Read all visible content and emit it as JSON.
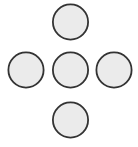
{
  "figure": {
    "name": "quincunx-dot-pattern",
    "width": 138,
    "height": 147,
    "background_color": "#ffffff"
  },
  "style": {
    "circle_fill": "#ebebeb",
    "circle_stroke": "#333333",
    "circle_stroke_width": 1.8,
    "circle_radius": 17.6,
    "circle_diameter": 35.2
  },
  "chart_data": {
    "type": "scatter",
    "title": "",
    "xlabel": "",
    "ylabel": "",
    "xlim": [
      0,
      138
    ],
    "ylim": [
      0,
      147
    ],
    "grid": false,
    "legend": null,
    "marker": "circle",
    "marker_size": 35.2,
    "points": [
      {
        "label": "top",
        "x": 70.5,
        "y": 22.0
      },
      {
        "label": "left",
        "x": 26.0,
        "y": 70.0
      },
      {
        "label": "center",
        "x": 70.5,
        "y": 70.0
      },
      {
        "label": "right",
        "x": 114.0,
        "y": 70.0
      },
      {
        "label": "bottom",
        "x": 70.5,
        "y": 120.0
      }
    ]
  }
}
